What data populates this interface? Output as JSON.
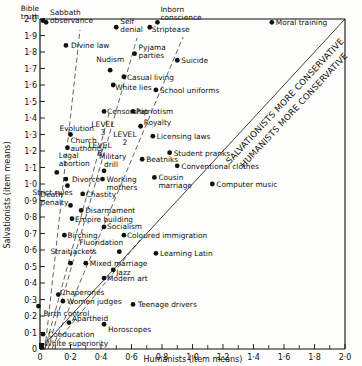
{
  "chart_data": {
    "type": "scatter",
    "title": "",
    "xlabel": "Humanists (item means)",
    "ylabel": "Salvationists (item means)",
    "xlim": [
      0,
      2.0
    ],
    "ylim": [
      0,
      2.0
    ],
    "grid": false,
    "x_ticks": [
      "0",
      "0·2",
      "0·4",
      "0·6",
      "0·8",
      "1·0",
      "1·2",
      "1·4",
      "1·6",
      "1·8",
      "2·0"
    ],
    "y_ticks": [
      "0",
      "0·1",
      "0·2",
      "0·3",
      "0·4",
      "0·5",
      "0·6",
      "0·7",
      "0·8",
      "0·9",
      "1·0",
      "1·1",
      "1·2",
      "1·3",
      "1·4",
      "1·5",
      "1·6",
      "1·7",
      "1·8",
      "1·9",
      "2·0"
    ],
    "points": [
      {
        "label": "Bible truth",
        "x": 0.02,
        "y": 1.99
      },
      {
        "label": "Sabbath observance",
        "x": 0.04,
        "y": 1.98
      },
      {
        "label": "Divine law",
        "x": 0.17,
        "y": 1.84
      },
      {
        "label": "Self denial",
        "x": 0.5,
        "y": 1.95
      },
      {
        "label": "Inborn conscience",
        "x": 0.77,
        "y": 1.98
      },
      {
        "label": "Striptease",
        "x": 0.72,
        "y": 1.95
      },
      {
        "label": "Moral training",
        "x": 1.52,
        "y": 1.98
      },
      {
        "label": "Pyjama parties",
        "x": 0.62,
        "y": 1.79
      },
      {
        "label": "Suicide",
        "x": 0.9,
        "y": 1.75
      },
      {
        "label": "Nudism",
        "x": 0.46,
        "y": 1.69
      },
      {
        "label": "Casual living",
        "x": 0.55,
        "y": 1.65
      },
      {
        "label": "White lies",
        "x": 0.48,
        "y": 1.6
      },
      {
        "label": "School uniforms",
        "x": 0.76,
        "y": 1.57
      },
      {
        "label": "Censorship",
        "x": 0.42,
        "y": 1.44
      },
      {
        "label": "Patriotism",
        "x": 0.61,
        "y": 1.44
      },
      {
        "label": "Royalty",
        "x": 0.66,
        "y": 1.35
      },
      {
        "label": "Licensing laws",
        "x": 0.74,
        "y": 1.29
      },
      {
        "label": "Evolution",
        "x": 0.2,
        "y": 1.3
      },
      {
        "label": "Church authority",
        "x": 0.18,
        "y": 1.22
      },
      {
        "label": "Student pranks",
        "x": 0.85,
        "y": 1.19
      },
      {
        "label": "Beatniks",
        "x": 0.67,
        "y": 1.15
      },
      {
        "label": "Conventional clothes",
        "x": 0.9,
        "y": 1.11
      },
      {
        "label": "Legal abortion",
        "x": 0.11,
        "y": 1.07
      },
      {
        "label": "Military drill",
        "x": 0.42,
        "y": 1.08
      },
      {
        "label": "Divorce",
        "x": 0.17,
        "y": 1.03
      },
      {
        "label": "Working mothers",
        "x": 0.41,
        "y": 1.03
      },
      {
        "label": "Cousin marriage",
        "x": 0.75,
        "y": 1.04
      },
      {
        "label": "Computer music",
        "x": 1.13,
        "y": 1.0
      },
      {
        "label": "Strict rules",
        "x": 0.18,
        "y": 0.99
      },
      {
        "label": "Chastity",
        "x": 0.28,
        "y": 0.94
      },
      {
        "label": "Death penalty",
        "x": 0.2,
        "y": 0.87
      },
      {
        "label": "Disarmament",
        "x": 0.27,
        "y": 0.84
      },
      {
        "label": "Empire building",
        "x": 0.21,
        "y": 0.79
      },
      {
        "label": "Socialism",
        "x": 0.42,
        "y": 0.74
      },
      {
        "label": "Coloured immigration",
        "x": 0.55,
        "y": 0.69
      },
      {
        "label": "Birching",
        "x": 0.16,
        "y": 0.69
      },
      {
        "label": "Fluoridation",
        "x": 0.52,
        "y": 0.59
      },
      {
        "label": "Learning Latin",
        "x": 0.76,
        "y": 0.58
      },
      {
        "label": "Straitjackets",
        "x": 0.2,
        "y": 0.52
      },
      {
        "label": "Mixed marriage",
        "x": 0.3,
        "y": 0.52
      },
      {
        "label": "Jazz",
        "x": 0.48,
        "y": 0.48
      },
      {
        "label": "Modern art",
        "x": 0.42,
        "y": 0.43
      },
      {
        "label": "Chaperones",
        "x": 0.12,
        "y": 0.33
      },
      {
        "label": "Women judges",
        "x": 0.15,
        "y": 0.29
      },
      {
        "label": "Teenage drivers",
        "x": 0.61,
        "y": 0.27
      },
      {
        "label": "Birth control",
        "x": -0.01,
        "y": 0.26
      },
      {
        "label": "Apartheid",
        "x": 0.19,
        "y": 0.16
      },
      {
        "label": "Horoscopes",
        "x": 0.42,
        "y": 0.15
      },
      {
        "label": "Coeducation",
        "x": 0.02,
        "y": 0.09
      },
      {
        "label": "White superiority",
        "x": 0.01,
        "y": 0.01
      }
    ],
    "annotations": [
      {
        "text": "LEVEL 6",
        "x": 0.21,
        "y": 1.41
      },
      {
        "text": "LEVEL 3",
        "x": 0.48,
        "y": 1.3
      },
      {
        "text": "LEVEL 2",
        "x": 0.6,
        "y": 1.25
      },
      {
        "text": "SALVATIONISTS MORE CONSERVATIVE",
        "position": "above diagonal"
      },
      {
        "text": "HUMANISTS MORE CONSERVATIVE",
        "position": "below diagonal"
      }
    ],
    "reference_lines": [
      {
        "type": "diagonal",
        "from": [
          0,
          0
        ],
        "to": [
          2,
          2
        ],
        "style": "solid"
      },
      {
        "type": "level",
        "name": "LEVEL 6",
        "style": "dashed",
        "slope": "steep"
      },
      {
        "type": "level",
        "name": "LEVEL 3",
        "style": "dashed"
      },
      {
        "type": "level",
        "name": "LEVEL 2",
        "style": "dashed"
      }
    ]
  }
}
